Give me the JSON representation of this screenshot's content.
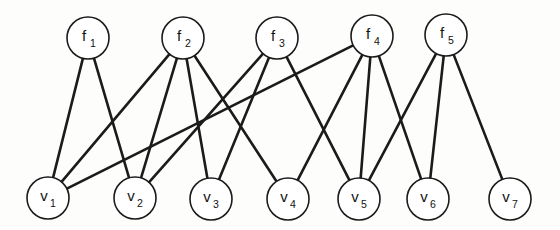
{
  "figure": {
    "background_color": "#fdfdfc",
    "edge_color": "#1b1b1b",
    "node_fill": "#ffffff",
    "node_stroke": "#1b1b1b",
    "node_radius": 21
  },
  "chart_data": {
    "type": "diagram",
    "subtype": "bipartite-graph",
    "title": "",
    "xlabel": "",
    "ylabel": "",
    "grid": false,
    "legend": "none",
    "top_row_label": "f",
    "bottom_row_label": "v",
    "nodes": {
      "factors": [
        {
          "id": "f1",
          "base": "f",
          "sub": "1",
          "x": 88,
          "y": 38
        },
        {
          "id": "f2",
          "base": "f",
          "sub": "2",
          "x": 183,
          "y": 38
        },
        {
          "id": "f3",
          "base": "f",
          "sub": "3",
          "x": 277,
          "y": 38
        },
        {
          "id": "f4",
          "base": "f",
          "sub": "4",
          "x": 372,
          "y": 36
        },
        {
          "id": "f5",
          "base": "f",
          "sub": "5",
          "x": 446,
          "y": 35
        }
      ],
      "variables": [
        {
          "id": "v1",
          "base": "v",
          "sub": "1",
          "x": 48,
          "y": 198
        },
        {
          "id": "v2",
          "base": "v",
          "sub": "2",
          "x": 135,
          "y": 198
        },
        {
          "id": "v3",
          "base": "v",
          "sub": "3",
          "x": 211,
          "y": 199
        },
        {
          "id": "v4",
          "base": "v",
          "sub": "4",
          "x": 288,
          "y": 199
        },
        {
          "id": "v5",
          "base": "v",
          "sub": "5",
          "x": 359,
          "y": 199
        },
        {
          "id": "v6",
          "base": "v",
          "sub": "6",
          "x": 428,
          "y": 199
        },
        {
          "id": "v7",
          "base": "v",
          "sub": "7",
          "x": 510,
          "y": 199
        }
      ]
    },
    "edges": [
      {
        "from": "f1",
        "to": "v1"
      },
      {
        "from": "f1",
        "to": "v2"
      },
      {
        "from": "f2",
        "to": "v1"
      },
      {
        "from": "f2",
        "to": "v2"
      },
      {
        "from": "f2",
        "to": "v3"
      },
      {
        "from": "f2",
        "to": "v4"
      },
      {
        "from": "f3",
        "to": "v2"
      },
      {
        "from": "f3",
        "to": "v3"
      },
      {
        "from": "f3",
        "to": "v5"
      },
      {
        "from": "f4",
        "to": "v1"
      },
      {
        "from": "f4",
        "to": "v4"
      },
      {
        "from": "f4",
        "to": "v5"
      },
      {
        "from": "f4",
        "to": "v6"
      },
      {
        "from": "f5",
        "to": "v5"
      },
      {
        "from": "f5",
        "to": "v6"
      },
      {
        "from": "f5",
        "to": "v7"
      }
    ],
    "degrees": {
      "f1": 2,
      "f2": 4,
      "f3": 3,
      "f4": 4,
      "f5": 3,
      "v1": 3,
      "v2": 3,
      "v3": 2,
      "v4": 2,
      "v5": 3,
      "v6": 2,
      "v7": 1
    },
    "edge_count": 16
  }
}
